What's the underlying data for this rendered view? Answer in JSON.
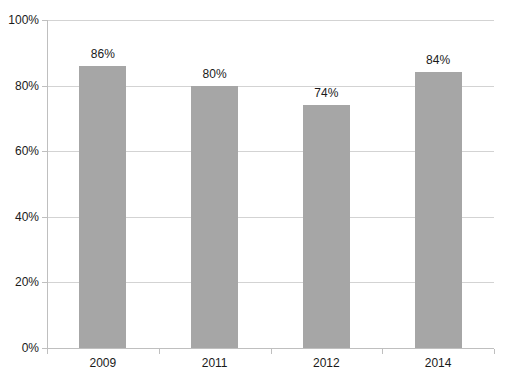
{
  "chart_data": {
    "type": "bar",
    "title": "",
    "subtitle": "",
    "xlabel": "",
    "ylabel": "",
    "categories": [
      "2009",
      "2011",
      "2012",
      "2014"
    ],
    "values": [
      86,
      80,
      74,
      84
    ],
    "value_labels": [
      "86%",
      "80%",
      "74%",
      "84%"
    ],
    "ylim": [
      0,
      100
    ],
    "ytick_values": [
      0,
      20,
      40,
      60,
      80,
      100
    ],
    "ytick_labels": [
      "0%",
      "20%",
      "40%",
      "60%",
      "80%",
      "100%"
    ],
    "grid": true,
    "legend": false,
    "legend_position": "none",
    "series": [
      {
        "name": "",
        "values": [
          86,
          80,
          74,
          84
        ]
      }
    ],
    "colors": {
      "bar": "#a6a6a6",
      "gridline": "#d3d3d3",
      "axis": "#bfbfbf",
      "text": "#1a1a1a",
      "background": "#ffffff"
    }
  }
}
